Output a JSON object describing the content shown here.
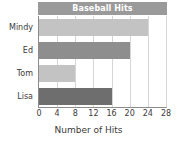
{
  "chart_data": {
    "type": "bar",
    "orientation": "horizontal",
    "title": "Baseball Hits",
    "xlabel": "Number of Hits",
    "ylabel": "",
    "categories": [
      "Mindy",
      "Ed",
      "Tom",
      "Lisa"
    ],
    "values": [
      24,
      20,
      8,
      16
    ],
    "bar_colors": [
      "#c3c3c3",
      "#8e8e8e",
      "#c3c3c3",
      "#6e6e6e"
    ],
    "xlim": [
      0,
      28
    ],
    "xticks": [
      0,
      4,
      8,
      12,
      16,
      20,
      24,
      28
    ],
    "xtick_labels": [
      "0",
      "4",
      "8",
      "12",
      "16",
      "20",
      "24",
      "28"
    ],
    "grid": "vertical",
    "legend": "none",
    "title_bar_color": "#9a9a9a",
    "title_text_color": "#ffffff",
    "gridline_color": "#d5d5d5",
    "axis_color": "#8c8c8c",
    "text_color": "#3b3b3b",
    "background": "#ffffff"
  }
}
